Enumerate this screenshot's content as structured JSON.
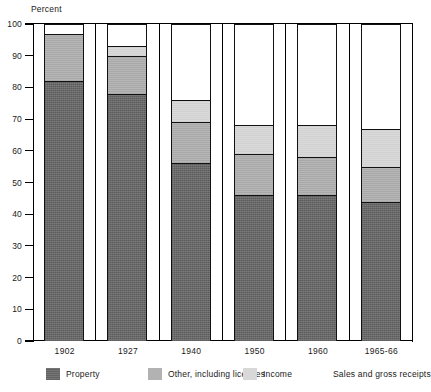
{
  "chart_data": {
    "type": "bar",
    "subtype": "stacked-bar-100",
    "title": "",
    "xlabel": "",
    "ylabel": "Percent",
    "ylim": [
      0,
      100
    ],
    "yticks": [
      0,
      10,
      20,
      30,
      40,
      50,
      60,
      70,
      80,
      90,
      100
    ],
    "ytick_labels": [
      "0",
      "10",
      "20",
      "30",
      "40",
      "50",
      "60",
      "70",
      "80",
      "90",
      "100"
    ],
    "grid": false,
    "legend_position": "bottom",
    "categories": [
      "1902",
      "1927",
      "1940",
      "1950",
      "1960",
      "1965-66"
    ],
    "series": [
      {
        "name": "Property",
        "color": "#6e6e6e",
        "values": [
          82,
          78,
          56,
          46,
          46,
          44
        ]
      },
      {
        "name": "Other, including licenses",
        "color": "#b2b2b2",
        "values": [
          15,
          12,
          13,
          13,
          12,
          11
        ]
      },
      {
        "name": "Income",
        "color": "#d8d8d8",
        "values": [
          0,
          3,
          7,
          9,
          10,
          12
        ]
      },
      {
        "name": "Sales and gross receipts",
        "color": "#ffffff",
        "values": [
          3,
          7,
          24,
          32,
          32,
          33
        ]
      }
    ],
    "cumulative_tops": [
      [
        82,
        97,
        97,
        100
      ],
      [
        78,
        90,
        93,
        100
      ],
      [
        56,
        69,
        76,
        100
      ],
      [
        46,
        59,
        68,
        100
      ],
      [
        46,
        58,
        68,
        100
      ],
      [
        44,
        55,
        67,
        100
      ]
    ]
  },
  "axis": {
    "y_title": "Percent"
  },
  "legend": {
    "items": [
      {
        "label": "Property",
        "swatch": "property"
      },
      {
        "label": "Other, including licenses",
        "swatch": "other"
      },
      {
        "label": "Income",
        "swatch": "income"
      },
      {
        "label": "Sales and gross receipts",
        "swatch": "sales"
      }
    ]
  }
}
